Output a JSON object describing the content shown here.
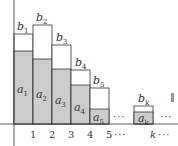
{
  "figure": {
    "colors": {
      "a_fill": "#cccccc",
      "b_fill": "#ffffff",
      "stroke": "#333333",
      "side_mark": "#999999"
    },
    "x_ticks": [
      "1",
      "2",
      "3",
      "4",
      "5",
      "k"
    ],
    "ellipsis": "···",
    "bars": [
      {
        "a": "a",
        "a_sub": "1",
        "b": "b",
        "b_sub": "1"
      },
      {
        "a": "a",
        "a_sub": "2",
        "b": "b",
        "b_sub": "2"
      },
      {
        "a": "a",
        "a_sub": "3",
        "b": "b",
        "b_sub": "3"
      },
      {
        "a": "a",
        "a_sub": "4",
        "b": "b",
        "b_sub": "4"
      },
      {
        "a": "a",
        "a_sub": "5",
        "b": "b",
        "b_sub": "5"
      },
      {
        "a": "a",
        "a_sub": "k",
        "b": "b",
        "b_sub": "k"
      }
    ]
  }
}
